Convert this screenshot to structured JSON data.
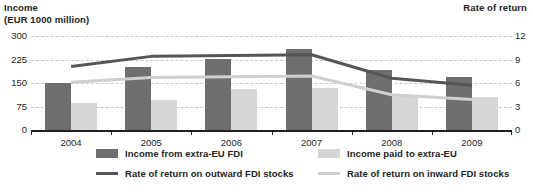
{
  "axis_titles": {
    "left": "Income\n(EUR 1000 million)",
    "right": "Rate of return"
  },
  "legend": {
    "bar_dark": "Income from extra-EU FDI",
    "bar_light": "Income paid to extra-EU",
    "line_dark": "Rate of return on outward FDI stocks",
    "line_light": "Rate of return on inward FDI stocks"
  },
  "colors": {
    "bar_dark": "#6e6e6e",
    "bar_light": "#d6d6d6",
    "line_dark": "#55565a",
    "line_light": "#cfcfcf",
    "gridline": "#c9c9c9",
    "axis": "#231f20"
  },
  "chart_data": {
    "type": "bar",
    "title": "",
    "subtitle": "",
    "xlabel": "",
    "ylabel": "Income (EUR 1000 million)",
    "y2label": "Rate of return",
    "categories": [
      "2004",
      "2005",
      "2006",
      "2007",
      "2008",
      "2009"
    ],
    "ylim": [
      0,
      300
    ],
    "yticks": [
      0,
      75,
      150,
      225,
      300
    ],
    "ytick_labels": [
      "0",
      "75",
      "150",
      "225",
      "300"
    ],
    "y2lim": [
      0,
      12
    ],
    "y2ticks": [
      0,
      3,
      6,
      9,
      12
    ],
    "y2tick_labels": [
      "0",
      "3",
      "6",
      "9",
      "12"
    ],
    "grid": true,
    "legend_position": "bottom",
    "series": [
      {
        "name": "Income from extra-EU FDI",
        "kind": "bar",
        "axis": "left",
        "color": "#6e6e6e",
        "values": [
          150,
          200,
          228,
          258,
          190,
          168
        ]
      },
      {
        "name": "Income paid to extra-EU",
        "kind": "bar",
        "axis": "left",
        "color": "#d6d6d6",
        "values": [
          85,
          97,
          130,
          135,
          112,
          105
        ]
      },
      {
        "name": "Rate of return on outward FDI stocks",
        "kind": "line",
        "axis": "right",
        "color": "#55565a",
        "values": [
          8.1,
          9.4,
          9.5,
          9.6,
          6.6,
          5.7
        ]
      },
      {
        "name": "Rate of return on inward FDI stocks",
        "kind": "line",
        "axis": "right",
        "color": "#cfcfcf",
        "values": [
          6.1,
          6.7,
          6.8,
          6.9,
          4.5,
          3.9
        ]
      }
    ]
  }
}
